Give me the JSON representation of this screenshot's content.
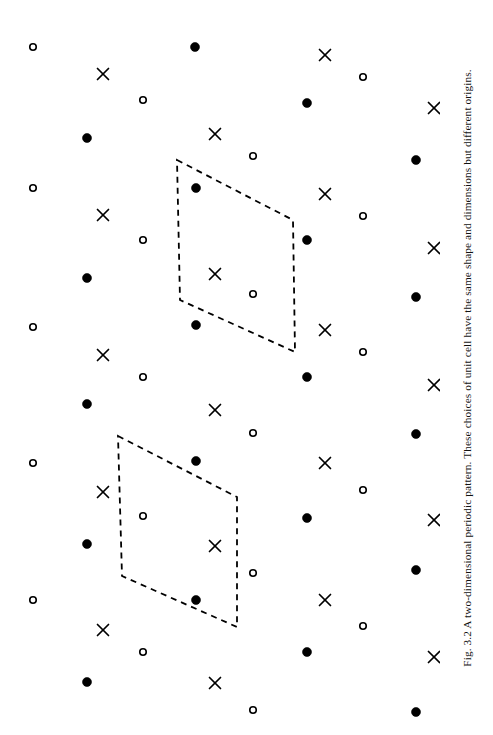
{
  "figure": {
    "caption": "Fig. 3.2 A two-dimensional periodic pattern. These choices of unit cell have the same shape and dimensions but different origins.",
    "caption_orientation": "rotated-90-ccw",
    "background_color": "#ffffff",
    "ink_color": "#000000",
    "width": 493,
    "height": 735
  },
  "chart_data": {
    "type": "scatter",
    "title": "A two-dimensional periodic pattern",
    "xlabel": "",
    "ylabel": "",
    "xlim": [
      0,
      440
    ],
    "ylim": [
      0,
      735
    ],
    "grid": false,
    "legend": "none",
    "lattice": {
      "vector_a": [
        118,
        61
      ],
      "vector_b": [
        -57,
        140
      ],
      "origin": [
        33,
        47
      ]
    },
    "motif": {
      "description": "Each lattice point carries one filled circle, one cross and one open circle",
      "offsets": [
        {
          "symbol": "filled-circle",
          "dx": 0,
          "dy": 0
        },
        {
          "symbol": "cross",
          "dx": 70,
          "dy": 27
        },
        {
          "symbol": "open-circle",
          "dx": 110,
          "dy": 53
        }
      ]
    },
    "symbols": [
      {
        "name": "filled-circle",
        "marker": "o",
        "fill": "#000000",
        "stroke": "#000000",
        "size": 9
      },
      {
        "name": "open-circle",
        "marker": "o",
        "fill": "none",
        "stroke": "#000000",
        "size": 8
      },
      {
        "name": "cross",
        "marker": "x",
        "fill": "none",
        "stroke": "#000000",
        "size": 11
      }
    ],
    "points": [
      {
        "symbol": "open-circle",
        "x": 33,
        "y": 47
      },
      {
        "symbol": "cross",
        "x": 103,
        "y": 74
      },
      {
        "symbol": "open-circle",
        "x": 143,
        "y": 100
      },
      {
        "symbol": "filled-circle",
        "x": 195,
        "y": 47
      },
      {
        "symbol": "cross",
        "x": 325,
        "y": 55
      },
      {
        "symbol": "open-circle",
        "x": 363,
        "y": 77
      },
      {
        "symbol": "filled-circle",
        "x": 307,
        "y": 103
      },
      {
        "symbol": "cross",
        "x": 434,
        "y": 108
      },
      {
        "symbol": "filled-circle",
        "x": 87,
        "y": 138
      },
      {
        "symbol": "cross",
        "x": 215,
        "y": 134
      },
      {
        "symbol": "open-circle",
        "x": 253,
        "y": 156
      },
      {
        "symbol": "filled-circle",
        "x": 416,
        "y": 160
      },
      {
        "symbol": "open-circle",
        "x": 33,
        "y": 188
      },
      {
        "symbol": "filled-circle",
        "x": 196,
        "y": 188
      },
      {
        "symbol": "cross",
        "x": 325,
        "y": 194
      },
      {
        "symbol": "open-circle",
        "x": 363,
        "y": 216
      },
      {
        "symbol": "cross",
        "x": 103,
        "y": 215
      },
      {
        "symbol": "open-circle",
        "x": 143,
        "y": 240
      },
      {
        "symbol": "filled-circle",
        "x": 307,
        "y": 240
      },
      {
        "symbol": "cross",
        "x": 434,
        "y": 248
      },
      {
        "symbol": "cross",
        "x": 215,
        "y": 274
      },
      {
        "symbol": "open-circle",
        "x": 253,
        "y": 294
      },
      {
        "symbol": "filled-circle",
        "x": 87,
        "y": 278
      },
      {
        "symbol": "filled-circle",
        "x": 416,
        "y": 297
      },
      {
        "symbol": "open-circle",
        "x": 33,
        "y": 327
      },
      {
        "symbol": "filled-circle",
        "x": 196,
        "y": 325
      },
      {
        "symbol": "cross",
        "x": 325,
        "y": 330
      },
      {
        "symbol": "open-circle",
        "x": 363,
        "y": 352
      },
      {
        "symbol": "cross",
        "x": 103,
        "y": 355
      },
      {
        "symbol": "open-circle",
        "x": 143,
        "y": 377
      },
      {
        "symbol": "filled-circle",
        "x": 307,
        "y": 377
      },
      {
        "symbol": "cross",
        "x": 434,
        "y": 385
      },
      {
        "symbol": "filled-circle",
        "x": 87,
        "y": 404
      },
      {
        "symbol": "cross",
        "x": 215,
        "y": 410
      },
      {
        "symbol": "open-circle",
        "x": 253,
        "y": 433
      },
      {
        "symbol": "filled-circle",
        "x": 416,
        "y": 434
      },
      {
        "symbol": "open-circle",
        "x": 33,
        "y": 463
      },
      {
        "symbol": "filled-circle",
        "x": 196,
        "y": 461
      },
      {
        "symbol": "cross",
        "x": 325,
        "y": 463
      },
      {
        "symbol": "open-circle",
        "x": 363,
        "y": 490
      },
      {
        "symbol": "cross",
        "x": 103,
        "y": 492
      },
      {
        "symbol": "open-circle",
        "x": 143,
        "y": 516
      },
      {
        "symbol": "filled-circle",
        "x": 307,
        "y": 518
      },
      {
        "symbol": "cross",
        "x": 434,
        "y": 520
      },
      {
        "symbol": "filled-circle",
        "x": 87,
        "y": 544
      },
      {
        "symbol": "cross",
        "x": 215,
        "y": 546
      },
      {
        "symbol": "open-circle",
        "x": 253,
        "y": 573
      },
      {
        "symbol": "filled-circle",
        "x": 416,
        "y": 570
      },
      {
        "symbol": "open-circle",
        "x": 33,
        "y": 600
      },
      {
        "symbol": "filled-circle",
        "x": 196,
        "y": 600
      },
      {
        "symbol": "cross",
        "x": 325,
        "y": 600
      },
      {
        "symbol": "open-circle",
        "x": 363,
        "y": 626
      },
      {
        "symbol": "cross",
        "x": 103,
        "y": 630
      },
      {
        "symbol": "open-circle",
        "x": 143,
        "y": 652
      },
      {
        "symbol": "filled-circle",
        "x": 307,
        "y": 652
      },
      {
        "symbol": "cross",
        "x": 434,
        "y": 657
      },
      {
        "symbol": "filled-circle",
        "x": 87,
        "y": 682
      },
      {
        "symbol": "cross",
        "x": 215,
        "y": 683
      },
      {
        "symbol": "open-circle",
        "x": 253,
        "y": 710
      },
      {
        "symbol": "filled-circle",
        "x": 416,
        "y": 712
      }
    ],
    "unit_cells": [
      {
        "name": "upper-unit-cell",
        "style": "dashed",
        "stroke": "#000000",
        "stroke_width": 1.8,
        "dash": "6 5",
        "vertices": [
          [
            177,
            160
          ],
          [
            293,
            220
          ],
          [
            295,
            352
          ],
          [
            180,
            300
          ]
        ]
      },
      {
        "name": "lower-unit-cell",
        "style": "dashed",
        "stroke": "#000000",
        "stroke_width": 1.8,
        "dash": "6 5",
        "vertices": [
          [
            118,
            436
          ],
          [
            237,
            497
          ],
          [
            237,
            627
          ],
          [
            122,
            576
          ]
        ]
      }
    ]
  }
}
